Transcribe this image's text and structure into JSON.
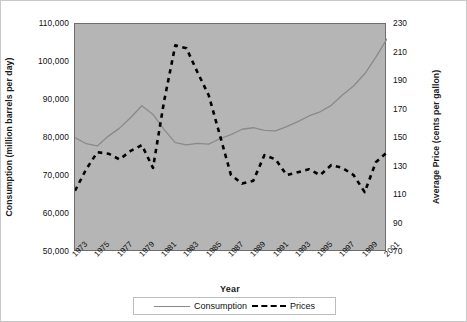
{
  "chart_data": {
    "type": "line",
    "title": "",
    "xlabel": "Year",
    "ylabel": "Consumption (million barrels per day)",
    "y2label": "Average Price (cents per gallon)",
    "grid": false,
    "legend_position": "bottom",
    "plot_background": "#b5b5b5",
    "x": [
      1973,
      1974,
      1975,
      1976,
      1977,
      1978,
      1979,
      1980,
      1981,
      1982,
      1983,
      1984,
      1985,
      1986,
      1987,
      1988,
      1989,
      1990,
      1991,
      1992,
      1993,
      1994,
      1995,
      1996,
      1997,
      1998,
      1999,
      2000,
      2001
    ],
    "x_ticklabels": [
      "1973",
      "1975",
      "1977",
      "1979",
      "1981",
      "1983",
      "1985",
      "1987",
      "1989",
      "1991",
      "1993",
      "1995",
      "1997",
      "1999",
      "2001"
    ],
    "xlim": [
      1973,
      2001
    ],
    "ylim": [
      50000,
      110000
    ],
    "y_ticklabels": [
      "50,000",
      "60,000",
      "70,000",
      "80,000",
      "90,000",
      "100,000",
      "110,000"
    ],
    "y_tickvalues": [
      50000,
      60000,
      70000,
      80000,
      90000,
      100000,
      110000
    ],
    "y2lim": [
      70,
      230
    ],
    "y2_ticklabels": [
      "70",
      "90",
      "110",
      "130",
      "150",
      "170",
      "190",
      "210",
      "230"
    ],
    "y2_tickvalues": [
      70,
      90,
      110,
      130,
      150,
      170,
      190,
      210,
      230
    ],
    "series": [
      {
        "name": "Consumption",
        "axis": "left",
        "style": "solid",
        "color": "#8a8a8a",
        "values": [
          80100,
          78500,
          77900,
          80500,
          82600,
          85400,
          88500,
          86200,
          82200,
          78800,
          78200,
          78600,
          78400,
          79800,
          80900,
          82300,
          82700,
          82000,
          81900,
          83000,
          84300,
          85800,
          86900,
          88600,
          91300,
          93700,
          96900,
          101300,
          106100
        ]
      },
      {
        "name": "Prices",
        "axis": "right",
        "style": "dashed",
        "color": "#000000",
        "values": [
          113,
          128,
          140,
          139,
          135,
          141,
          145,
          129,
          176,
          215,
          213,
          196,
          180,
          152,
          124,
          118,
          120,
          138,
          135,
          124,
          126,
          128,
          124,
          131,
          129,
          124,
          112,
          133,
          140
        ]
      }
    ]
  },
  "axes": {
    "left_title": "Consumption (million barrels per day)",
    "right_title": "Average Price (cents per gallon)",
    "x_title": "Year"
  },
  "legend": {
    "items": [
      {
        "label": "Consumption",
        "marker": "solid-line-swatch"
      },
      {
        "label": "Prices",
        "marker": "dashed-line-swatch"
      }
    ]
  }
}
